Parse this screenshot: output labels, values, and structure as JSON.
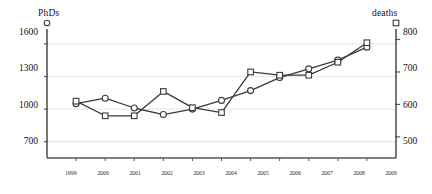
{
  "chart_data": {
    "type": "line",
    "title": "",
    "xlabel": "",
    "grid": true,
    "legend_position": "above-axes",
    "categories": [
      "1999",
      "2000",
      "2001",
      "2002",
      "2003",
      "2004",
      "2005",
      "2006",
      "2007",
      "2008",
      "2009"
    ],
    "series": [
      {
        "name": "PhDs",
        "marker": "circle",
        "axis": "left",
        "axis_label": "PhDs",
        "ylim": [
          550,
          1700
        ],
        "yticks": [
          700,
          1000,
          1300,
          1600
        ],
        "values": [
          1050,
          1100,
          1010,
          950,
          1000,
          1080,
          1170,
          1290,
          1370,
          1450,
          1570
        ]
      },
      {
        "name": "deaths",
        "marker": "square",
        "axis": "right",
        "axis_label": "deaths",
        "ylim": [
          435,
          820
        ],
        "yticks": [
          500,
          600,
          700,
          800
        ],
        "values": [
          610,
          565,
          565,
          640,
          590,
          575,
          700,
          690,
          690,
          730,
          790
        ]
      }
    ],
    "colors": {
      "line": "#3a3a3a",
      "marker_fill": "#ffffff",
      "grid": "#e2e2e2",
      "axis": "#555555",
      "text": "#111111"
    }
  },
  "axes": {
    "left": {
      "title": "PhDs",
      "tick_labels": [
        "1600",
        "1300",
        "1000",
        "700"
      ],
      "legend_marker": "circle-marker-icon"
    },
    "right": {
      "title": "deaths",
      "tick_labels": [
        "800",
        "700",
        "600",
        "500"
      ],
      "legend_marker": "square-marker-icon"
    },
    "bottom": {
      "tick_labels": [
        "1999",
        "2000",
        "2001",
        "2002",
        "2003",
        "2004",
        "2005",
        "2006",
        "2007",
        "2008",
        "2009"
      ]
    }
  }
}
